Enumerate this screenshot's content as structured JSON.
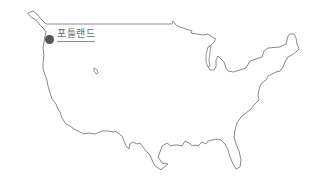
{
  "map": {
    "region": "Contiguous United States",
    "outline_color": "#8a8a8a",
    "background_color": "#ffffff",
    "markers": [
      {
        "label": "포틀랜드",
        "icon": "location-dot-icon",
        "color": "#555555"
      }
    ]
  }
}
